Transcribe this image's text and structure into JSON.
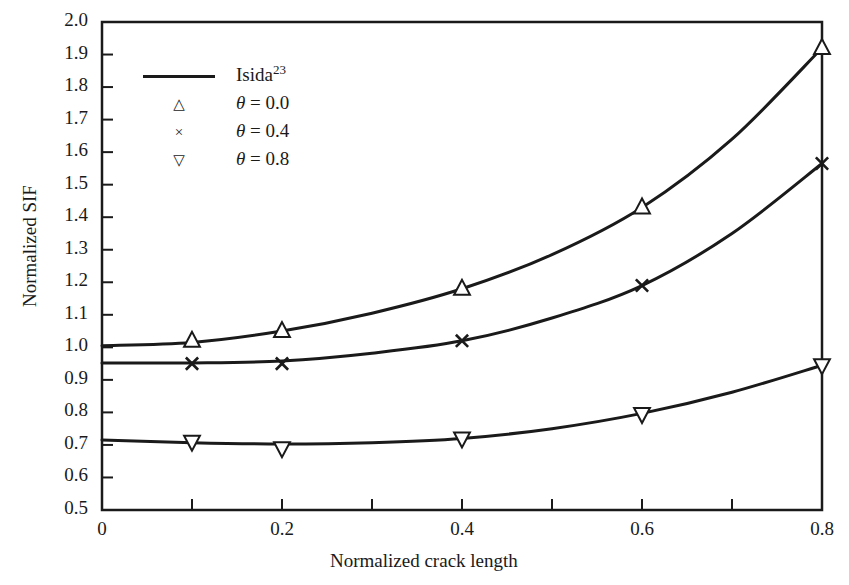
{
  "chart_data": {
    "type": "line",
    "title": "",
    "xlabel": "Normalized crack length",
    "ylabel": "Normalized SIF",
    "xlim": [
      0,
      0.8
    ],
    "ylim": [
      0.5,
      2.0
    ],
    "xticks": [
      0,
      0.1,
      0.2,
      0.3,
      0.4,
      0.5,
      0.6,
      0.7,
      0.8
    ],
    "xticklabels": [
      "0",
      "",
      "0.2",
      "",
      "0.4",
      "",
      "0.6",
      "",
      "0.8"
    ],
    "yticks": [
      0.5,
      0.6,
      0.7,
      0.8,
      0.9,
      1.0,
      1.1,
      1.2,
      1.3,
      1.4,
      1.5,
      1.6,
      1.7,
      1.8,
      1.9,
      2.0
    ],
    "yticklabels": [
      "0.5",
      "0.6",
      "0.7",
      "0.8",
      "0.9",
      "1.0",
      "1.1",
      "1.2",
      "1.3",
      "1.4",
      "1.5",
      "1.6",
      "1.7",
      "1.8",
      "1.9",
      "2.0"
    ],
    "grid": false,
    "legend_position": "upper left",
    "line_color": "#1a1a1a",
    "reference_curves": [
      {
        "name": "Isida reference (theta = 0.0)",
        "x": [
          0.0,
          0.1,
          0.2,
          0.3,
          0.4,
          0.5,
          0.6,
          0.7,
          0.8
        ],
        "y": [
          1.005,
          1.015,
          1.05,
          1.105,
          1.18,
          1.285,
          1.43,
          1.64,
          1.92
        ]
      },
      {
        "name": "Isida reference (theta = 0.4)",
        "x": [
          0.0,
          0.1,
          0.2,
          0.3,
          0.4,
          0.5,
          0.6,
          0.7,
          0.8
        ],
        "y": [
          0.952,
          0.952,
          0.958,
          0.982,
          1.02,
          1.09,
          1.19,
          1.35,
          1.565
        ]
      },
      {
        "name": "Isida reference (theta = 0.8)",
        "x": [
          0.0,
          0.1,
          0.2,
          0.3,
          0.4,
          0.5,
          0.6,
          0.7,
          0.8
        ],
        "y": [
          0.715,
          0.707,
          0.703,
          0.707,
          0.72,
          0.75,
          0.797,
          0.862,
          0.945
        ]
      }
    ],
    "series": [
      {
        "name": "θ = 0.0",
        "marker": "triangle-up",
        "x": [
          0.1,
          0.2,
          0.4,
          0.6,
          0.8
        ],
        "y": [
          1.02,
          1.05,
          1.18,
          1.43,
          1.92
        ]
      },
      {
        "name": "θ = 0.4",
        "marker": "x",
        "x": [
          0.1,
          0.2,
          0.4,
          0.6,
          0.8
        ],
        "y": [
          0.95,
          0.95,
          1.02,
          1.19,
          1.565
        ]
      },
      {
        "name": "θ = 0.8",
        "marker": "triangle-down",
        "x": [
          0.1,
          0.2,
          0.4,
          0.6,
          0.8
        ],
        "y": [
          0.71,
          0.69,
          0.72,
          0.795,
          0.945
        ]
      }
    ]
  },
  "legend": {
    "entries": [
      {
        "symbol": "line",
        "label_main": "Isida",
        "label_sup": "23",
        "theta": false
      },
      {
        "symbol": "△",
        "label_main": " = 0.0",
        "label_sup": "",
        "theta": true
      },
      {
        "symbol": "×",
        "label_main": " = 0.4",
        "label_sup": "",
        "theta": true
      },
      {
        "symbol": "▽",
        "label_main": " = 0.8",
        "label_sup": "",
        "theta": true
      }
    ]
  },
  "axes": {
    "y_title": "Normalized SIF",
    "x_title": "Normalized crack length"
  }
}
